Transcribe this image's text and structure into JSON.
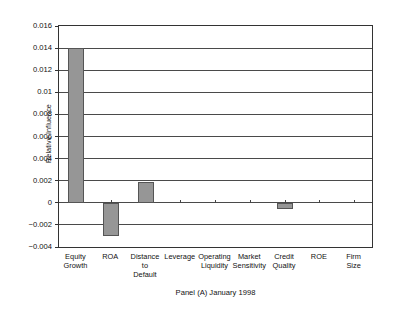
{
  "chart_data": {
    "type": "bar",
    "title": "",
    "caption": "Panel (A) January 1998",
    "xlabel": "",
    "ylabel": "Relative Influence",
    "ylim": [
      -0.004,
      0.016
    ],
    "ytick_values": [
      -0.004,
      -0.002,
      0,
      0.002,
      0.004,
      0.006,
      0.008,
      0.01,
      0.012,
      0.014,
      0.016
    ],
    "ytick_labels": [
      "−0.004",
      "−0.002",
      "0",
      "0.002",
      "0.004",
      "0.006",
      "0.008",
      "0.01",
      "0.012",
      "0.014",
      "0.016"
    ],
    "grid": true,
    "legend": "none",
    "categories": [
      "Equity\nGrowth",
      "ROA",
      "Distance\nto\nDefault",
      "Leverage",
      "Operating\nLiquidity",
      "Market\nSensitivity",
      "Credit\nQuality",
      "ROE",
      "Firm\nSize"
    ],
    "category_labels": [
      [
        "Equity",
        "Growth"
      ],
      [
        "ROA"
      ],
      [
        "Distance",
        "to",
        "Default"
      ],
      [
        "Leverage"
      ],
      [
        "Operating",
        "Liquidity"
      ],
      [
        "Market",
        "Sensitivity"
      ],
      [
        "Credit",
        "Quality"
      ],
      [
        "ROE"
      ],
      [
        "Firm",
        "Size"
      ]
    ],
    "values": [
      0.014,
      -0.003,
      0.0019,
      0,
      0,
      0,
      -0.0006,
      0,
      0
    ],
    "bar_color": "#969696",
    "bar_edge_color": "#555555"
  }
}
